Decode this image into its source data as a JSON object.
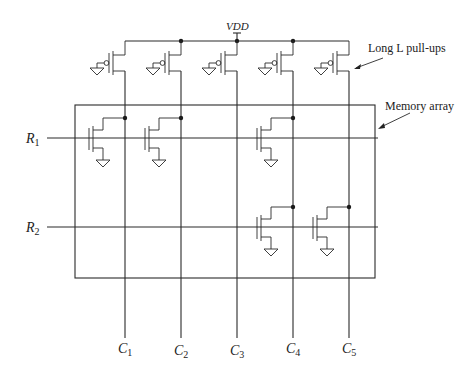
{
  "diagram": {
    "supply_label": "VDD",
    "annotations": {
      "pullups": "Long L pull-ups",
      "array": "Memory array"
    },
    "rows": [
      {
        "label": "R",
        "sub": "1",
        "y": 138,
        "transistors_at_columns": [
          1,
          2,
          4
        ]
      },
      {
        "label": "R",
        "sub": "2",
        "y": 227,
        "transistors_at_columns": [
          4,
          5
        ]
      }
    ],
    "columns": [
      {
        "label": "C",
        "sub": "1",
        "x": 125
      },
      {
        "label": "C",
        "sub": "2",
        "x": 181
      },
      {
        "label": "C",
        "sub": "3",
        "x": 237
      },
      {
        "label": "C",
        "sub": "4",
        "x": 293
      },
      {
        "label": "C",
        "sub": "5",
        "x": 349
      }
    ],
    "colors": {
      "line": "#2a2a2a",
      "background": "#ffffff"
    }
  }
}
